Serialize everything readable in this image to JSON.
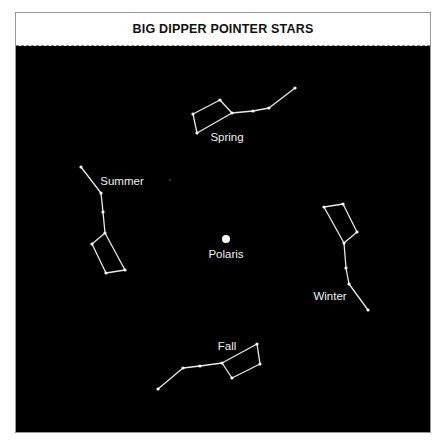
{
  "title": "BIG DIPPER POINTER STARS",
  "colors": {
    "sky": "#000000",
    "lines": "#e8e8e8",
    "title_bg": "#ffffff"
  },
  "center_star": {
    "name": "Polaris",
    "x": 226,
    "y": 239
  },
  "constellations": [
    {
      "season": "Spring",
      "label_pos": [
        227,
        141
      ],
      "points": [
        [
          197,
          133
        ],
        [
          193,
          114
        ],
        [
          220,
          100
        ],
        [
          232,
          113
        ],
        [
          197,
          133
        ],
        [
          232,
          113
        ],
        [
          253,
          111
        ],
        [
          269,
          108
        ],
        [
          295,
          88
        ]
      ]
    },
    {
      "season": "Summer",
      "label_pos": [
        122,
        185
      ],
      "points": [
        [
          81,
          167
        ],
        [
          101,
          193
        ],
        [
          103,
          212
        ],
        [
          105,
          233
        ],
        [
          92,
          244
        ],
        [
          106,
          273
        ],
        [
          125,
          270
        ],
        [
          105,
          233
        ]
      ]
    },
    {
      "season": "Winter",
      "label_pos": [
        330,
        300
      ],
      "points": [
        [
          324,
          207
        ],
        [
          343,
          204
        ],
        [
          357,
          232
        ],
        [
          344,
          243
        ],
        [
          324,
          207
        ],
        [
          344,
          243
        ],
        [
          346,
          268
        ],
        [
          349,
          284
        ],
        [
          368,
          310
        ]
      ]
    },
    {
      "season": "Fall",
      "label_pos": [
        227,
        350
      ],
      "points": [
        [
          158,
          389
        ],
        [
          183,
          368
        ],
        [
          200,
          366
        ],
        [
          222,
          363
        ],
        [
          257,
          344
        ],
        [
          260,
          364
        ],
        [
          232,
          378
        ],
        [
          222,
          363
        ]
      ]
    }
  ]
}
